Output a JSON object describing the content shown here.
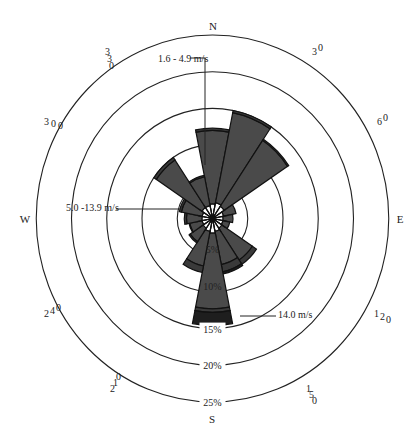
{
  "chart_data": {
    "type": "windrose",
    "title": "",
    "center": {
      "x": 212.5,
      "y": 218.5
    },
    "scale_px_per_pct": {
      "x": 7.05,
      "y": 7.34
    },
    "rings_pct": [
      5,
      10,
      15,
      20,
      25
    ],
    "ring_labels": [
      "5%",
      "10%",
      "15%",
      "20%",
      "25%"
    ],
    "cardinal_labels": [
      {
        "label": "N",
        "x": 213,
        "y": 30
      },
      {
        "label": "E",
        "x": 400,
        "y": 223
      },
      {
        "label": "S",
        "x": 212,
        "y": 423
      },
      {
        "label": "W",
        "x": 25,
        "y": 223
      }
    ],
    "degree_labels": [
      {
        "deg": "30",
        "text": [
          "3",
          "0"
        ],
        "x": 312,
        "y": 55
      },
      {
        "deg": "60",
        "text": [
          "6",
          "0"
        ],
        "x": 377,
        "y": 125
      },
      {
        "deg": "120",
        "text": [
          "1",
          "2",
          "0"
        ],
        "x": 374,
        "y": 317
      },
      {
        "deg": "150",
        "text": [
          "1",
          "5",
          "0"
        ],
        "x": 306,
        "y": 392
      },
      {
        "deg": "210",
        "text": [
          "2",
          "1",
          "0"
        ],
        "x": 110,
        "y": 392
      },
      {
        "deg": "240",
        "text": [
          "2",
          "4",
          "0"
        ],
        "x": 44,
        "y": 317
      },
      {
        "deg": "300",
        "text": [
          "3",
          "0",
          "0"
        ],
        "x": 44,
        "y": 125
      },
      {
        "deg": "330",
        "text": [
          "3",
          "3",
          "0"
        ],
        "x": 105,
        "y": 55
      }
    ],
    "speed_bins": [
      {
        "name": "0.5 - 1.5 m/s",
        "color": "#ffffff"
      },
      {
        "name": "1.6 - 4.9 m/s",
        "color": "#4a4a4a"
      },
      {
        "name": "5.0 -13.9 m/s",
        "color": "#3a3a3a"
      },
      {
        "name": "14.0 m/s",
        "color": "#1e1e1e"
      }
    ],
    "legend_callouts": [
      {
        "label": "1.6 - 4.9 m/s",
        "text_x": 158,
        "text_y": 62,
        "line": [
          [
            190,
            58
          ],
          [
            205,
            58
          ],
          [
            205,
            165
          ]
        ]
      },
      {
        "label": "5.0 -13.9 m/s",
        "text_x": 66,
        "text_y": 211,
        "line": [
          [
            116,
            209
          ],
          [
            180,
            209
          ]
        ]
      },
      {
        "label": "14.0 m/s",
        "text_x": 278,
        "text_y": 318,
        "line": [
          [
            240,
            316
          ],
          [
            276,
            316
          ]
        ]
      }
    ],
    "directions": [
      "N",
      "NNE",
      "NE",
      "ENE",
      "E",
      "ESE",
      "SE",
      "SSE",
      "S",
      "SSW",
      "SW",
      "WSW",
      "W",
      "WNW",
      "NW",
      "NNW"
    ],
    "series": [
      {
        "name": "0.5 - 1.5 m/s",
        "values": [
          2.0,
          2.2,
          2.0,
          1.6,
          1.5,
          1.5,
          1.6,
          1.8,
          2.0,
          1.8,
          1.6,
          1.5,
          1.5,
          1.5,
          1.8,
          1.8
        ]
      },
      {
        "name": "1.6 - 4.9 m/s",
        "values": [
          10.0,
          12.5,
          10.8,
          1.8,
          1.4,
          1.0,
          5.2,
          4.6,
          10.3,
          4.8,
          2.2,
          1.8,
          2.2,
          3.0,
          7.8,
          4.0
        ]
      },
      {
        "name": "5.0 -13.9 m/s",
        "values": [
          0.3,
          0.3,
          0.2,
          0.0,
          0.0,
          0.0,
          0.7,
          1.0,
          0.5,
          0.9,
          0.2,
          0.1,
          0.3,
          0.3,
          0.4,
          0.2
        ]
      },
      {
        "name": "14.0 m/s",
        "values": [
          0.0,
          0.0,
          0.0,
          0.0,
          0.0,
          0.0,
          0.0,
          0.3,
          1.8,
          0.0,
          0.0,
          0.0,
          0.0,
          0.0,
          0.0,
          0.0
        ]
      }
    ],
    "totals_pct": [
      12.3,
      15.0,
      13.0,
      3.4,
      2.9,
      2.5,
      7.5,
      7.7,
      14.6,
      7.5,
      4.0,
      3.4,
      4.0,
      4.8,
      10.0,
      6.0
    ],
    "inner_white_ring_pct": [
      2.0,
      2.2,
      2.0,
      1.6,
      1.5,
      1.5,
      1.6,
      1.8,
      2.0,
      1.8,
      1.6,
      1.5,
      1.5,
      1.5,
      1.8,
      1.8
    ],
    "grid": true,
    "legend_position": "callouts"
  }
}
